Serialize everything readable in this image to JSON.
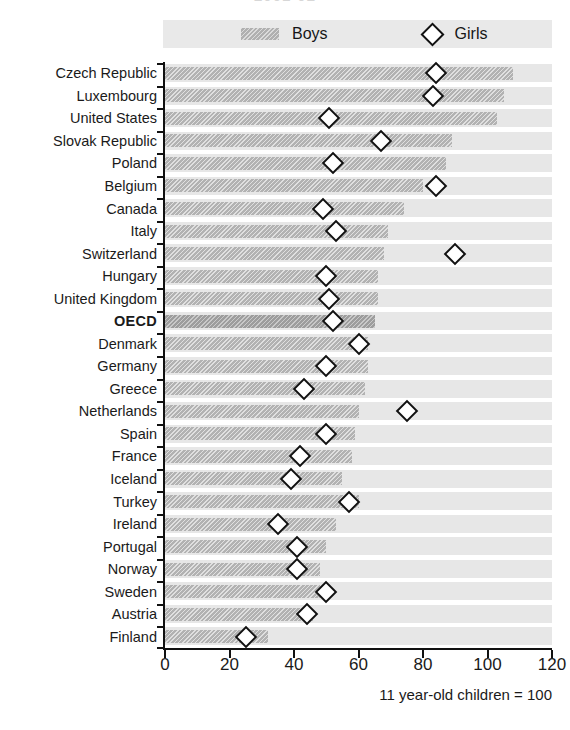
{
  "title_sliver": "2001-02",
  "legend": {
    "boys_label": "Boys",
    "girls_label": "Girls",
    "boys_swatch_color": "#b0b0b0",
    "girls_marker": "diamond-outline"
  },
  "footnote": "11 year-old children = 100",
  "axis": {
    "x_ticks": [
      "0",
      "20",
      "40",
      "60",
      "80",
      "100",
      "120"
    ],
    "x_min": 0,
    "x_max": 120,
    "x_step": 20
  },
  "chart_data": {
    "type": "bar",
    "title": "2001-02",
    "xlabel": "11 year-old children = 100",
    "ylabel": "",
    "xlim": [
      0,
      120
    ],
    "grid": true,
    "legend_position": "top",
    "orientation": "horizontal",
    "categories": [
      "Czech Republic",
      "Luxembourg",
      "United States",
      "Slovak Republic",
      "Poland",
      "Belgium",
      "Canada",
      "Italy",
      "Switzerland",
      "Hungary",
      "United Kingdom",
      "OECD",
      "Denmark",
      "Germany",
      "Greece",
      "Netherlands",
      "Spain",
      "France",
      "Iceland",
      "Turkey",
      "Ireland",
      "Portugal",
      "Norway",
      "Sweden",
      "Austria",
      "Finland"
    ],
    "highlight_category": "OECD",
    "series": [
      {
        "name": "Boys",
        "type": "bar",
        "values": [
          108,
          105,
          103,
          89,
          87,
          80,
          74,
          69,
          68,
          66,
          66,
          65,
          63,
          63,
          62,
          60,
          59,
          58,
          55,
          60,
          53,
          50,
          48,
          48,
          46,
          32
        ]
      },
      {
        "name": "Girls",
        "type": "scatter",
        "marker": "diamond",
        "values": [
          84,
          83,
          51,
          67,
          52,
          84,
          49,
          53,
          90,
          50,
          51,
          52,
          60,
          50,
          43,
          75,
          50,
          42,
          39,
          57,
          35,
          41,
          41,
          50,
          44,
          25
        ]
      }
    ]
  }
}
